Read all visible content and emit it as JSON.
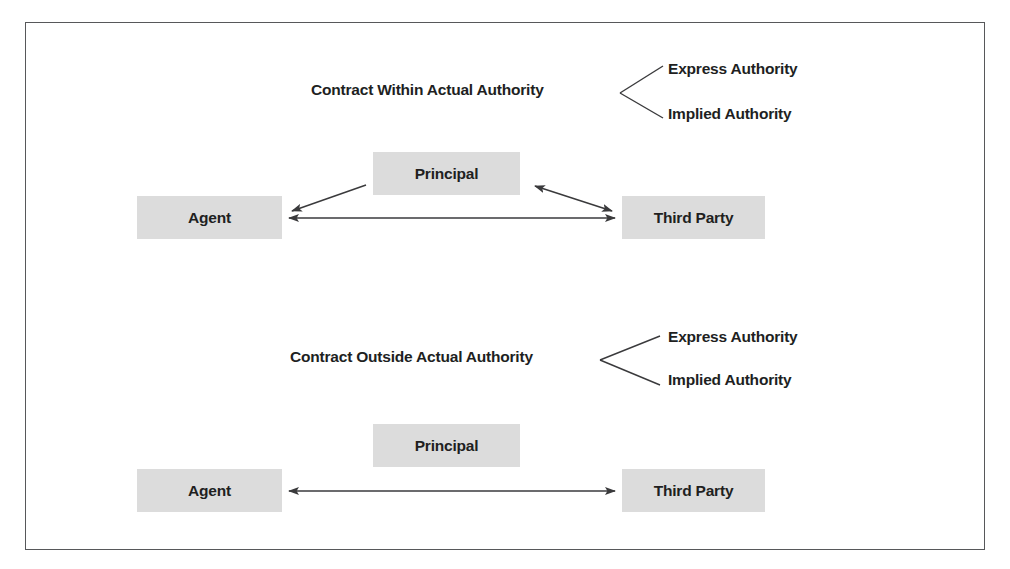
{
  "figure": {
    "frame_color": "#57585a",
    "box_fill": "#dcdcdc",
    "text_color": "#211f1f",
    "line_color": "#3a3a3c"
  },
  "sections": [
    {
      "id": "within-actual-authority",
      "heading": "Contract Within Actual Authority",
      "branches": [
        {
          "label": "Express Authority"
        },
        {
          "label": "Implied Authority"
        }
      ],
      "nodes": {
        "principal": "Principal",
        "agent": "Agent",
        "third_party": "Third Party"
      },
      "connectors": [
        {
          "name": "principal-to-agent",
          "from": "principal",
          "to": "agent",
          "heads": "single"
        },
        {
          "name": "principal-third-party",
          "from": "principal",
          "to": "third_party",
          "heads": "double"
        },
        {
          "name": "agent-third-party",
          "from": "agent",
          "to": "third_party",
          "heads": "double"
        }
      ]
    },
    {
      "id": "outside-actual-authority",
      "heading": "Contract Outside Actual Authority",
      "branches": [
        {
          "label": "Express Authority"
        },
        {
          "label": "Implied Authority"
        }
      ],
      "nodes": {
        "principal": "Principal",
        "agent": "Agent",
        "third_party": "Third Party"
      },
      "connectors": [
        {
          "name": "agent-third-party",
          "from": "agent",
          "to": "third_party",
          "heads": "double"
        }
      ]
    }
  ]
}
